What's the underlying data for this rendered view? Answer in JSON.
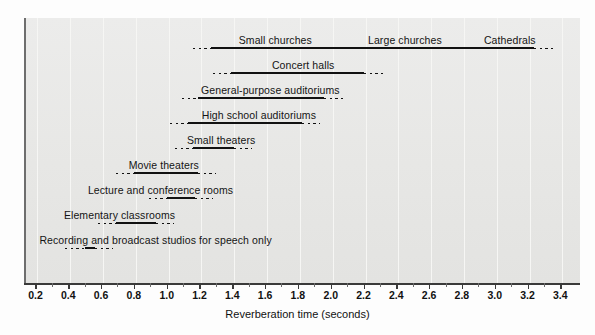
{
  "chart_data": {
    "type": "bar",
    "title": "",
    "subtitle": "",
    "xlabel": "Reverberation time (seconds)",
    "ylabel": "",
    "xlim": [
      0.13,
      3.52
    ],
    "grid": true,
    "legend": null,
    "orientation": "horizontal",
    "xticks": [
      0.2,
      0.4,
      0.6,
      0.8,
      1.0,
      1.2,
      1.4,
      1.6,
      1.8,
      2.0,
      2.2,
      2.4,
      2.6,
      2.8,
      3.0,
      3.2,
      3.4
    ],
    "xticklabels": [
      "0.2",
      "0.4",
      "0.6",
      "0.8",
      "1.0",
      "1.2",
      "1.4",
      "1.6",
      "1.8",
      "2.0",
      "2.2",
      "2.4",
      "2.6",
      "2.8",
      "3.0",
      "3.2",
      "3.4"
    ],
    "categories": [
      "Small churches",
      "Large churches",
      "Cathedrals",
      "Concert halls",
      "General-purpose auditoriums",
      "High school auditoriums",
      "Small theaters",
      "Movie theaters",
      "Lecture and conference rooms",
      "Elementary classrooms",
      "Recording and broadcast studios for speech only"
    ],
    "rows": [
      {
        "labels": [
          "Small churches",
          "Large churches",
          "Cathedrals"
        ],
        "label_positions": [
          1.65,
          2.44,
          3.08
        ],
        "dotted_start": 1.15,
        "solid_start": 1.26,
        "solid_end": 3.23,
        "dotted_end": 3.36
      },
      {
        "labels": [
          "Concert halls"
        ],
        "label_positions": [
          1.82
        ],
        "dotted_start": 1.27,
        "solid_start": 1.38,
        "solid_end": 2.19,
        "dotted_end": 2.31
      },
      {
        "labels": [
          "General-purpose auditoriums"
        ],
        "label_positions": [
          1.62
        ],
        "dotted_start": 1.08,
        "solid_start": 1.18,
        "solid_end": 1.95,
        "dotted_end": 2.06
      },
      {
        "labels": [
          "High school auditoriums"
        ],
        "label_positions": [
          1.55
        ],
        "dotted_start": 1.01,
        "solid_start": 1.12,
        "solid_end": 1.81,
        "dotted_end": 1.92
      },
      {
        "labels": [
          "Small theaters"
        ],
        "label_positions": [
          1.32
        ],
        "dotted_start": 1.04,
        "solid_start": 1.15,
        "solid_end": 1.4,
        "dotted_end": 1.51
      },
      {
        "labels": [
          "Movie theaters"
        ],
        "label_positions": [
          0.97
        ],
        "dotted_start": 0.68,
        "solid_start": 0.79,
        "solid_end": 1.18,
        "dotted_end": 1.29
      },
      {
        "labels": [
          "Lecture and conference rooms"
        ],
        "label_positions": [
          0.95
        ],
        "dotted_start": 0.88,
        "solid_start": 0.99,
        "solid_end": 1.16,
        "dotted_end": 1.27
      },
      {
        "labels": [
          "Elementary classrooms"
        ],
        "label_positions": [
          0.7
        ],
        "dotted_start": 0.57,
        "solid_start": 0.68,
        "solid_end": 0.92,
        "dotted_end": 1.03
      },
      {
        "labels": [
          "Recording and broadcast studios for speech only"
        ],
        "label_positions": [
          0.92
        ],
        "dotted_start": 0.37,
        "solid_start": 0.49,
        "solid_end": 0.55,
        "dotted_end": 0.66
      }
    ]
  },
  "figure": {
    "xlabel": "Reverberation time (seconds)",
    "panel_color": "#e9e9e7",
    "bar_color": "#111111",
    "axis_color": "#3a3a3a",
    "grid_color": "#f6f6f4"
  }
}
